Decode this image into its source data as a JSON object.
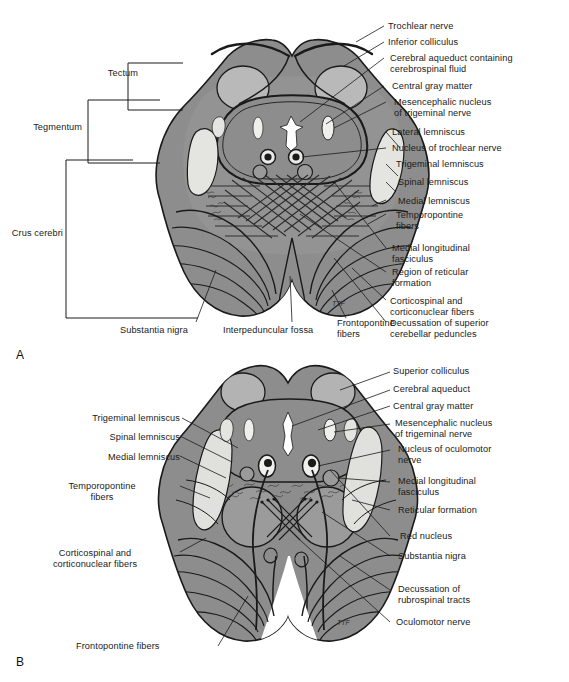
{
  "figure": {
    "panels": [
      {
        "letter": "A",
        "level": "Level of the inferior colliculus",
        "bracket_labels": [
          {
            "key": "tectum",
            "text": "Tectum"
          },
          {
            "key": "tegmentum",
            "text": "Tegmentum"
          },
          {
            "key": "crus_cerebri",
            "text": "Crus cerebri"
          }
        ],
        "right_labels": [
          {
            "key": "trochlear_nerve",
            "text": "Trochlear nerve"
          },
          {
            "key": "inferior_colliculus",
            "text": "Inferior colliculus"
          },
          {
            "key": "cerebral_aqueduct_csf",
            "text": "Cerebral aqueduct containing\ncerebrospinal fluid"
          },
          {
            "key": "central_gray_matter",
            "text": "Central gray matter"
          },
          {
            "key": "mesencephalic_nucleus",
            "text": "Mesencephalic nucleus\nof trigeminal nerve"
          },
          {
            "key": "lateral_lemniscus",
            "text": "Lateral lemniscus"
          },
          {
            "key": "nucleus_trochlear_nerve",
            "text": "Nucleus of trochlear nerve"
          },
          {
            "key": "trigeminal_lemniscus",
            "text": "Trigeminal lemniscus"
          },
          {
            "key": "spinal_lemniscus",
            "text": "Spinal lemniscus"
          },
          {
            "key": "medial_lemniscus",
            "text": "Medial lemniscus"
          },
          {
            "key": "temporopontine_fibers",
            "text": "Temporopontine\nfibers"
          },
          {
            "key": "medial_longitudinal_fasciculus",
            "text": "Medial longitudinal\nfasciculus"
          },
          {
            "key": "region_reticular_formation",
            "text": "Region of reticular\nformation"
          },
          {
            "key": "corticospinal_corticonuclear",
            "text": "Corticospinal and\ncorticonuclear fibers"
          },
          {
            "key": "decussation_scp",
            "text": "Decussation of superior\ncerebellar peduncles"
          }
        ],
        "bottom_labels": [
          {
            "key": "substantia_nigra",
            "text": "Substantia nigra"
          },
          {
            "key": "interpeduncular_fossa",
            "text": "Interpeduncular fossa"
          },
          {
            "key": "frontopontine_fibers",
            "text": "Frontopontine\nfibers"
          }
        ],
        "signature": "TTF"
      },
      {
        "letter": "B",
        "level": "Level of the superior colliculus",
        "left_labels": [
          {
            "key": "trigeminal_lemniscus",
            "text": "Trigeminal lemniscus"
          },
          {
            "key": "spinal_lemniscus",
            "text": "Spinal lemniscus"
          },
          {
            "key": "medial_lemniscus",
            "text": "Medial lemniscus"
          },
          {
            "key": "temporopontine_fibers",
            "text": "Temporopontine\nfibers"
          },
          {
            "key": "corticospinal_corticonuclear",
            "text": "Corticospinal and\ncorticonuclear fibers"
          }
        ],
        "right_labels": [
          {
            "key": "superior_colliculus",
            "text": "Superior colliculus"
          },
          {
            "key": "cerebral_aqueduct",
            "text": "Cerebral aqueduct"
          },
          {
            "key": "central_gray_matter",
            "text": "Central gray matter"
          },
          {
            "key": "mesencephalic_nucleus",
            "text": "Mesencephalic nucleus\nof trigeminal nerve"
          },
          {
            "key": "nucleus_oculomotor_nerve",
            "text": "Nucleus of oculomotor\nnerve"
          },
          {
            "key": "medial_longitudinal_fasciculus",
            "text": "Medial longitudinal\nfasciculus"
          },
          {
            "key": "reticular_formation",
            "text": "Reticular formation"
          },
          {
            "key": "red_nucleus",
            "text": "Red nucleus"
          },
          {
            "key": "substantia_nigra",
            "text": "Substantia nigra"
          },
          {
            "key": "decussation_rubrospinal",
            "text": "Decussation of\nrubrospinal tracts"
          },
          {
            "key": "oculomotor_nerve",
            "text": "Oculomotor nerve"
          }
        ],
        "bottom_labels": [
          {
            "key": "frontopontine_fibers",
            "text": "Frontopontine fibers"
          }
        ],
        "signature": "TTF"
      }
    ],
    "colors": {
      "tissue": "#8d8d8d",
      "tissue_light": "#b9b9b9",
      "tissue_lighter": "#cfcfcf",
      "white_matter": "#e8e8e6",
      "outline": "#1a1a1a",
      "background": "#ffffff",
      "text": "#1a1a1a"
    }
  }
}
